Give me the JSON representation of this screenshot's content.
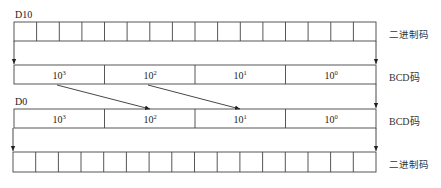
{
  "diagram": {
    "registers": {
      "source": {
        "label": "D10"
      },
      "dest": {
        "label": "D0"
      }
    },
    "rows": [
      {
        "id": "top-binary",
        "type": "binary",
        "cells": 16,
        "side_label": "二进制码"
      },
      {
        "id": "top-bcd",
        "type": "bcd",
        "digits": [
          {
            "base": "10",
            "exp": "3"
          },
          {
            "base": "10",
            "exp": "2"
          },
          {
            "base": "10",
            "exp": "1"
          },
          {
            "base": "10",
            "exp": "0"
          }
        ],
        "side_label": "BCD码"
      },
      {
        "id": "bottom-bcd",
        "type": "bcd",
        "digits": [
          {
            "base": "10",
            "exp": "3"
          },
          {
            "base": "10",
            "exp": "2"
          },
          {
            "base": "10",
            "exp": "1"
          },
          {
            "base": "10",
            "exp": "0"
          }
        ],
        "side_label": "BCD码"
      },
      {
        "id": "bottom-binary",
        "type": "binary",
        "cells": 16,
        "side_label": "二进制码"
      }
    ],
    "arrows": [
      {
        "from": "top-bcd 10^3",
        "to": "bottom-bcd 10^2"
      },
      {
        "from": "top-bcd 10^2",
        "to": "bottom-bcd 10^1"
      }
    ],
    "colors": {
      "line": "#333333",
      "text": "#222222",
      "background": "#ffffff"
    }
  }
}
